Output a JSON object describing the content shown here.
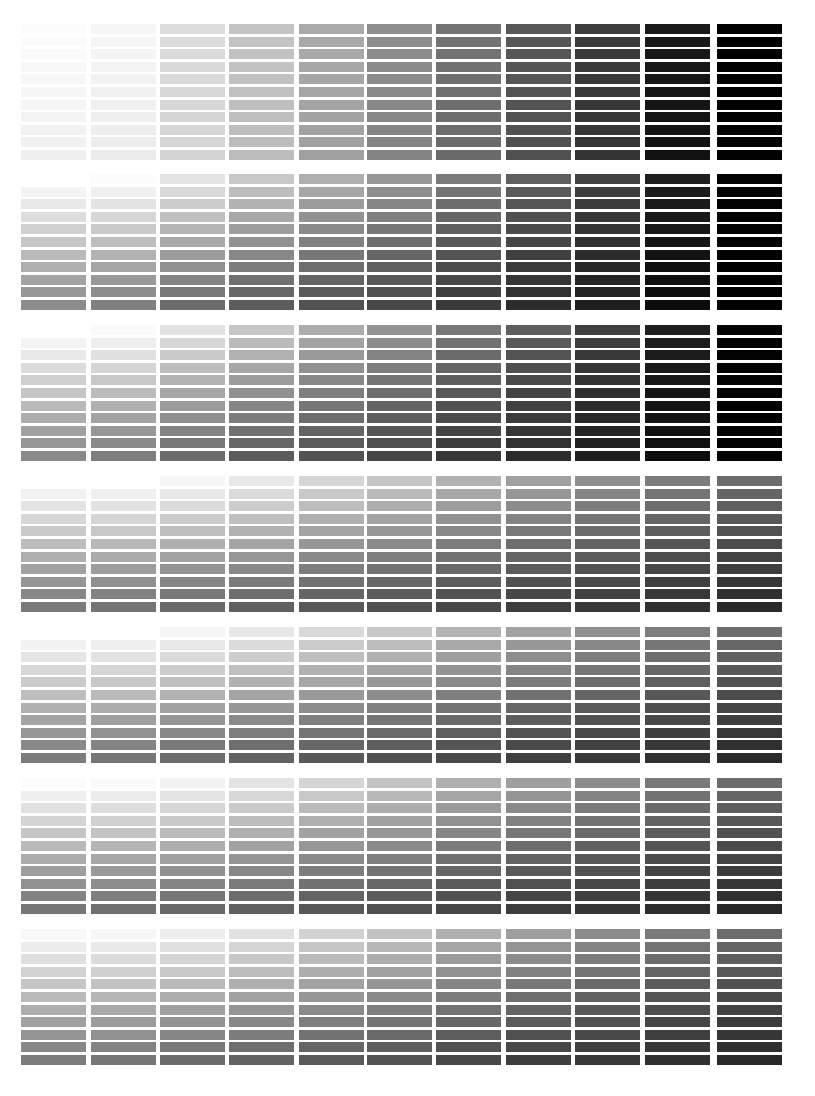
{
  "chart_data": {
    "type": "heatmap",
    "title": "",
    "layout": {
      "columns": 11,
      "rows_per_block": 11,
      "block_top_y": [
        24,
        174,
        325,
        476,
        627,
        778,
        929
      ],
      "column_left_x": [
        21,
        91,
        160,
        229,
        299,
        367,
        436,
        506,
        575,
        645,
        717
      ],
      "cell_width": 65,
      "cell_height": 10,
      "row_pitch": 12.6
    },
    "blocks": [
      {
        "name": "block-1",
        "top_row": [
          252,
          246,
          220,
          196,
          170,
          142,
          116,
          88,
          60,
          26,
          2
        ],
        "bottom_row": [
          240,
          236,
          212,
          188,
          160,
          132,
          106,
          80,
          52,
          18,
          1
        ]
      },
      {
        "name": "block-2",
        "top_row": [
          255,
          252,
          228,
          200,
          175,
          150,
          122,
          95,
          66,
          30,
          3
        ],
        "bottom_row": [
          140,
          128,
          108,
          92,
          82,
          72,
          58,
          44,
          30,
          12,
          2
        ]
      },
      {
        "name": "block-3",
        "top_row": [
          255,
          250,
          226,
          198,
          172,
          148,
          120,
          94,
          64,
          30,
          3
        ],
        "bottom_row": [
          138,
          126,
          108,
          92,
          82,
          70,
          56,
          44,
          30,
          14,
          2
        ]
      },
      {
        "name": "block-4",
        "top_row": [
          255,
          254,
          246,
          232,
          214,
          198,
          178,
          160,
          142,
          124,
          108
        ],
        "bottom_row": [
          122,
          116,
          106,
          96,
          88,
          80,
          72,
          62,
          56,
          48,
          42
        ]
      },
      {
        "name": "block-5",
        "top_row": [
          255,
          254,
          246,
          232,
          216,
          200,
          180,
          162,
          144,
          126,
          110
        ],
        "bottom_row": [
          124,
          118,
          108,
          98,
          90,
          82,
          74,
          64,
          56,
          48,
          42
        ]
      },
      {
        "name": "block-6",
        "top_row": [
          252,
          250,
          242,
          228,
          212,
          196,
          176,
          158,
          140,
          122,
          108
        ],
        "bottom_row": [
          118,
          112,
          104,
          96,
          88,
          80,
          70,
          60,
          54,
          46,
          40
        ]
      },
      {
        "name": "block-7",
        "top_row": [
          248,
          246,
          238,
          226,
          210,
          194,
          176,
          158,
          140,
          122,
          108
        ],
        "bottom_row": [
          124,
          118,
          108,
          98,
          90,
          82,
          72,
          62,
          56,
          48,
          40
        ]
      }
    ]
  }
}
